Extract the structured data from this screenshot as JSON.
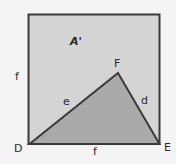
{
  "diagram": {
    "colors": {
      "background": "#f4f4f4",
      "square_fill": "#d4d4d4",
      "triangle_fill": "#aaaaaa",
      "stroke": "#3a3a3a"
    },
    "square": {
      "x": 28,
      "y": 14,
      "width": 132,
      "height": 130
    },
    "triangle": {
      "vertices": {
        "D": [
          29,
          144
        ],
        "E": [
          160,
          144
        ],
        "F": [
          118,
          73
        ]
      }
    },
    "labels": {
      "area": "A'",
      "vertex_F": "F",
      "vertex_D": "D",
      "vertex_E": "E",
      "side_e": "e",
      "side_d": "d",
      "side_left_f": "f",
      "side_bottom_f": "f"
    }
  }
}
